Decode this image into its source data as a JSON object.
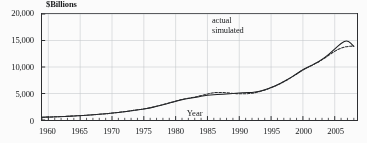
{
  "chart_data": {
    "type": "line",
    "title": "",
    "xlabel": "Year",
    "ylabel": "$Billions",
    "xlim": [
      1959,
      2008.5
    ],
    "ylim": [
      0,
      20000
    ],
    "grid": true,
    "legend_position": "top-center-right",
    "y_ticks": [
      0,
      5000,
      10000,
      15000,
      20000
    ],
    "y_tick_labels": [
      "0",
      "5,000",
      "10,000",
      "15,000",
      "20,000"
    ],
    "x_ticks": [
      1960,
      1965,
      1970,
      1975,
      1980,
      1985,
      1990,
      1995,
      2000,
      2005
    ],
    "x_tick_labels": [
      "1960",
      "1965",
      "1970",
      "1975",
      "1980",
      "1985",
      "1990",
      "1995",
      "2000",
      "2005"
    ],
    "x_minor_tick_interval": 1,
    "x": [
      1959,
      1960,
      1961,
      1962,
      1963,
      1964,
      1965,
      1966,
      1967,
      1968,
      1969,
      1970,
      1971,
      1972,
      1973,
      1974,
      1975,
      1976,
      1977,
      1978,
      1979,
      1980,
      1981,
      1982,
      1983,
      1984,
      1985,
      1986,
      1987,
      1988,
      1989,
      1990,
      1991,
      1992,
      1993,
      1994,
      1995,
      1996,
      1997,
      1998,
      1999,
      2000,
      2001,
      2002,
      2003,
      2004,
      2005,
      2006,
      2007,
      2008
    ],
    "series": [
      {
        "name": "actual",
        "style": "solid",
        "color": "#1a1c1e",
        "values": [
          520,
          560,
          600,
          650,
          700,
          760,
          830,
          900,
          980,
          1080,
          1180,
          1290,
          1420,
          1570,
          1740,
          1910,
          2080,
          2300,
          2560,
          2870,
          3200,
          3520,
          3840,
          4060,
          4250,
          4470,
          4640,
          4760,
          4830,
          4900,
          5000,
          5100,
          5160,
          5200,
          5380,
          5700,
          6130,
          6630,
          7250,
          7950,
          8700,
          9500,
          10100,
          10700,
          11400,
          12300,
          13400,
          14500,
          15100,
          13900
        ]
      },
      {
        "name": "simulated",
        "style": "dashed",
        "color": "#26282b",
        "values": [
          520,
          560,
          600,
          650,
          700,
          760,
          830,
          900,
          980,
          1080,
          1180,
          1290,
          1420,
          1570,
          1740,
          1910,
          2080,
          2300,
          2570,
          2890,
          3240,
          3570,
          3890,
          4120,
          4330,
          4600,
          4900,
          5180,
          5210,
          5130,
          5020,
          4930,
          4940,
          5030,
          5280,
          5640,
          6080,
          6580,
          7200,
          7900,
          8650,
          9450,
          10050,
          10650,
          11350,
          12150,
          13000,
          13600,
          13900,
          13950
        ]
      }
    ]
  }
}
